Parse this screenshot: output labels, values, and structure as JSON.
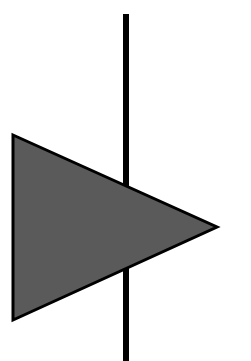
{
  "diagram": {
    "type": "symbol",
    "elements": {
      "vertical_line": {
        "x": 126,
        "y1": 14,
        "y2": 361,
        "width": 6,
        "color": "#000000"
      },
      "triangle": {
        "points": [
          [
            13,
            135
          ],
          [
            217,
            227
          ],
          [
            13,
            320
          ]
        ],
        "fill": "#5a5a5a",
        "stroke": "#000000",
        "stroke_width": 3,
        "direction": "right"
      }
    },
    "background": "#ffffff"
  }
}
